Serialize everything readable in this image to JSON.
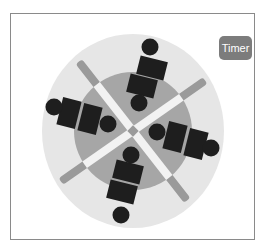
{
  "timer_button": {
    "label": "Timer",
    "color": "#7c7c7c"
  },
  "colors": {
    "frame_border": "#8a8a8a",
    "outer_circle": "#e6e6e6",
    "inner_circle": "#a6a6a6",
    "spoke_inner": "#f2f2f2",
    "spoke_outer": "#9a9a9a",
    "figure": "#1e1e1e"
  },
  "table": {
    "center": [
      133,
      131
    ],
    "outer_radius": [
      91,
      97
    ],
    "inner_radius": 59,
    "spokes": [
      {
        "angle": 52,
        "name": "spoke-nw-se"
      },
      {
        "angle": -35,
        "name": "spoke-ne-sw"
      }
    ]
  },
  "seats": [
    {
      "name": "seat-top-outer",
      "head": [
        150,
        47
      ],
      "body": [
        152,
        68,
        28,
        19,
        14
      ]
    },
    {
      "name": "seat-top-inner",
      "head": [
        139,
        103
      ],
      "body": [
        142,
        86,
        28,
        19,
        14
      ]
    },
    {
      "name": "seat-left-outer",
      "head": [
        54,
        107
      ],
      "body": [
        69,
        113,
        19,
        28,
        14
      ]
    },
    {
      "name": "seat-left-inner",
      "head": [
        108,
        124
      ],
      "body": [
        90,
        119,
        19,
        28,
        14
      ]
    },
    {
      "name": "seat-right-inner",
      "head": [
        157,
        132
      ],
      "body": [
        175,
        137,
        19,
        28,
        14
      ]
    },
    {
      "name": "seat-right-outer",
      "head": [
        211,
        148
      ],
      "body": [
        196,
        144,
        19,
        28,
        14
      ]
    },
    {
      "name": "seat-bottom-inner",
      "head": [
        131,
        155
      ],
      "body": [
        128,
        172,
        28,
        19,
        14
      ]
    },
    {
      "name": "seat-bottom-outer",
      "head": [
        121,
        215
      ],
      "body": [
        122,
        192,
        28,
        19,
        14
      ]
    }
  ]
}
